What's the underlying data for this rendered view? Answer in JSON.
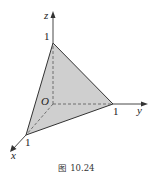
{
  "figure": {
    "caption": "图 10.24",
    "type": "3d-coordinate-diagram"
  },
  "axes": {
    "x": {
      "label": "x",
      "tick": "1"
    },
    "y": {
      "label": "y",
      "tick": "1"
    },
    "z": {
      "label": "z",
      "tick": "1"
    },
    "origin": {
      "label": "O"
    }
  },
  "colors": {
    "fill": "#cfcfcf",
    "stroke": "#333333",
    "background": "#ffffff"
  }
}
